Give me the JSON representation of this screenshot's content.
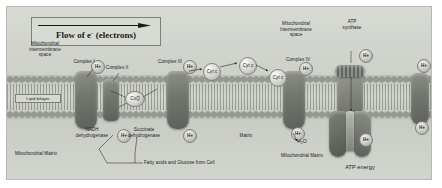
{
  "figure": {
    "title_box": {
      "text": "Flow of e",
      "superscript": "–",
      "suffix": " (electrons)",
      "arrow": "rightward-arrow"
    },
    "compartments": {
      "intermembrane_space_left": "Mitochondrial\nintermembrane\nspace",
      "intermembrane_space_right": "Mitochondrial\nIntermembrane\nspace",
      "matrix_left": "Mitochondrial Matrix",
      "matrix_center": "Matrix",
      "matrix_right": "Mitochondrial Matrix",
      "lipid_bilayer": "Lipid bilayer"
    },
    "complexes": [
      {
        "name": "Complex I",
        "label": "Complex I"
      },
      {
        "name": "Complex II",
        "label": "Complex II"
      },
      {
        "name": "Complex III",
        "label": "Complex III"
      },
      {
        "name": "Complex IV",
        "label": "Complex IV"
      },
      {
        "name": "ATP synthase",
        "label": "ATP\nsynthase"
      }
    ],
    "mobile_carriers": {
      "coq": "CoQ",
      "cyt_c_1": "Cyt c",
      "cyt_c_2": "Cyt c",
      "cyt_c_3": "Cyt c"
    },
    "enzymes": {
      "nadh": "NADH\ndehydrogenase",
      "succinate": "Succinate\ndehydrogenase"
    },
    "products": {
      "water": "H₂O",
      "atp_energy": "ATP  energy"
    },
    "substrate_note": "Fatty acids and Glucose from Cell",
    "proton_label": "H+",
    "colors": {
      "background": "#ffffff",
      "card": "#cfd2cc",
      "membrane": "#c6c9c2",
      "complex": "#72756e",
      "atp_synthase": "#6b6e67",
      "text": "#20221d"
    }
  }
}
